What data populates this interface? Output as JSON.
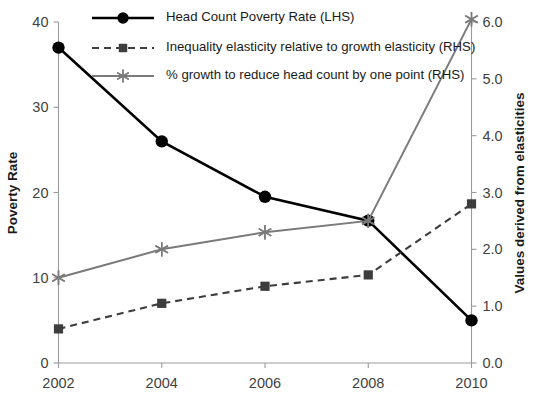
{
  "chart_data": {
    "type": "line",
    "title": "",
    "xlabel": "",
    "categories": [
      "2002",
      "2004",
      "2006",
      "2008",
      "2010"
    ],
    "x": [
      2002,
      2004,
      2006,
      2008,
      2010
    ],
    "xlim": [
      2002,
      2010
    ],
    "grid": false,
    "legend_position": "top-center",
    "axes": {
      "left": {
        "label": "Poverty Rate",
        "ylim": [
          0,
          40
        ],
        "ticks": [
          0,
          10,
          20,
          30,
          40
        ],
        "tick_labels": [
          "0",
          "10",
          "20",
          "30",
          "40"
        ]
      },
      "right": {
        "label": "Values derived from elasticities",
        "ylim": [
          0.0,
          6.0
        ],
        "ticks": [
          0.0,
          1.0,
          2.0,
          3.0,
          4.0,
          5.0,
          6.0
        ],
        "tick_labels": [
          "0.0",
          "1.0",
          "2.0",
          "3.0",
          "4.0",
          "5.0",
          "6.0"
        ]
      }
    },
    "series": [
      {
        "name": "Head Count Poverty Rate (LHS)",
        "axis": "left",
        "marker": "circle",
        "line_style": "solid",
        "color": "#000000",
        "values": [
          37.0,
          26.0,
          19.5,
          16.7,
          5.0
        ]
      },
      {
        "name": "Inequality elasticity relative to growth elasticity (RHS)",
        "axis": "right",
        "marker": "square",
        "line_style": "dashed",
        "color": "#3d3d3d",
        "values": [
          0.6,
          1.05,
          1.35,
          1.55,
          2.8
        ]
      },
      {
        "name": "% growth to reduce head count by one point (RHS)",
        "axis": "right",
        "marker": "asterisk",
        "line_style": "solid",
        "color": "#7a7a7a",
        "values": [
          1.5,
          2.0,
          2.3,
          2.5,
          6.05
        ]
      }
    ]
  },
  "legend": {
    "items": [
      {
        "label": "Head Count Poverty Rate (LHS)"
      },
      {
        "label": "Inequality elasticity relative to growth elasticity (RHS)"
      },
      {
        "label": "% growth to reduce head count by one point (RHS)"
      }
    ]
  },
  "colors": {
    "series1": "#000000",
    "series2": "#3d3d3d",
    "series3": "#7a7a7a",
    "axis": "#9a9a9a",
    "text": "#1a1a1a",
    "tick_text": "#3f3f3f",
    "background": "#ffffff"
  }
}
